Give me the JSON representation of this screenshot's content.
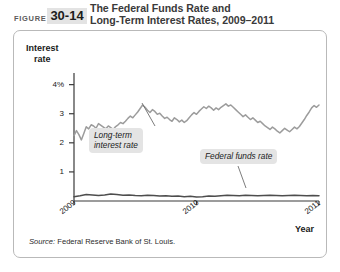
{
  "header": {
    "figure_word": "FIGURE",
    "figure_number": "30-14",
    "title_line1": "The Federal Funds Rate and",
    "title_line2": "Long-Term Interest Rates, 2009–2011"
  },
  "source": {
    "label": "Source:",
    "text": " Federal Reserve Bank of St. Louis."
  },
  "colors": {
    "long_term_line": "#9c9c9c",
    "federal_funds_line": "#4d4d4d",
    "axis": "#3a3a3a",
    "callout_background": "#e4e4e4",
    "panel_border": "#b9b9b9",
    "figure_number_background": "#e3e3e3",
    "title_text": "#3a3a3a"
  },
  "chart_data": {
    "type": "line",
    "title": "The Federal Funds Rate and Long-Term Interest Rates, 2009–2011",
    "xlabel": "Year",
    "ylabel": "Interest rate",
    "ylabel_line1": "Interest",
    "ylabel_line2": "rate",
    "grid": false,
    "legend": "annotations",
    "xlim": [
      2009.0,
      2011.0
    ],
    "ylim": [
      0,
      4.4
    ],
    "ytick_labels": [
      "4%",
      "3",
      "2",
      "1"
    ],
    "ytick_values": [
      4,
      3,
      2,
      1
    ],
    "xtick_labels": [
      "2009",
      "2010",
      "2011"
    ],
    "xtick_values": [
      2009,
      2010,
      2011
    ],
    "annotations": [
      {
        "name": "long-term-interest-rate",
        "line1": "Long-term",
        "line2": "interest rate"
      },
      {
        "name": "federal-funds-rate",
        "line1": "Federal funds rate",
        "line2": ""
      }
    ],
    "series": [
      {
        "name": "Long-term interest rate",
        "color": "#9c9c9c",
        "x": [
          2009.0,
          2009.02,
          2009.04,
          2009.06,
          2009.08,
          2009.1,
          2009.12,
          2009.14,
          2009.16,
          2009.18,
          2009.2,
          2009.22,
          2009.24,
          2009.26,
          2009.28,
          2009.3,
          2009.32,
          2009.34,
          2009.36,
          2009.38,
          2009.4,
          2009.42,
          2009.44,
          2009.46,
          2009.48,
          2009.5,
          2009.52,
          2009.54,
          2009.56,
          2009.58,
          2009.6,
          2009.62,
          2009.64,
          2009.66,
          2009.68,
          2009.7,
          2009.72,
          2009.74,
          2009.76,
          2009.78,
          2009.8,
          2009.82,
          2009.84,
          2009.86,
          2009.88,
          2009.9,
          2009.92,
          2009.94,
          2009.96,
          2009.98,
          2010.0,
          2010.02,
          2010.04,
          2010.06,
          2010.08,
          2010.1,
          2010.12,
          2010.14,
          2010.16,
          2010.18,
          2010.2,
          2010.22,
          2010.24,
          2010.26,
          2010.28,
          2010.3,
          2010.32,
          2010.34,
          2010.36,
          2010.38,
          2010.4,
          2010.42,
          2010.44,
          2010.46,
          2010.48,
          2010.5,
          2010.52,
          2010.54,
          2010.56,
          2010.58,
          2010.6,
          2010.62,
          2010.64,
          2010.66,
          2010.68,
          2010.7,
          2010.72,
          2010.74,
          2010.76,
          2010.78,
          2010.8,
          2010.82,
          2010.84,
          2010.86,
          2010.88,
          2010.9,
          2010.92,
          2010.94,
          2010.96,
          2010.98,
          2011.0
        ],
        "y": [
          2.25,
          2.42,
          2.28,
          2.1,
          2.32,
          2.55,
          2.48,
          2.62,
          2.58,
          2.5,
          2.66,
          2.6,
          2.54,
          2.48,
          2.58,
          2.52,
          2.46,
          2.56,
          2.62,
          2.7,
          2.66,
          2.74,
          2.84,
          2.92,
          2.86,
          2.96,
          3.06,
          3.18,
          3.3,
          3.22,
          3.12,
          3.04,
          3.14,
          3.08,
          2.98,
          3.02,
          2.92,
          2.84,
          2.88,
          2.8,
          2.74,
          2.86,
          2.8,
          2.72,
          2.78,
          2.7,
          2.76,
          2.86,
          2.96,
          3.04,
          2.98,
          3.08,
          3.16,
          3.24,
          3.18,
          3.26,
          3.2,
          3.12,
          3.2,
          3.14,
          3.22,
          3.28,
          3.34,
          3.26,
          3.3,
          3.22,
          3.14,
          3.06,
          2.98,
          2.9,
          2.96,
          2.88,
          2.8,
          2.86,
          2.78,
          2.7,
          2.74,
          2.66,
          2.58,
          2.52,
          2.46,
          2.54,
          2.48,
          2.4,
          2.34,
          2.42,
          2.5,
          2.44,
          2.38,
          2.46,
          2.54,
          2.48,
          2.56,
          2.68,
          2.8,
          2.94,
          3.06,
          3.2,
          3.28,
          3.22,
          3.3
        ]
      },
      {
        "name": "Federal funds rate",
        "color": "#4d4d4d",
        "x": [
          2009.0,
          2009.05,
          2009.1,
          2009.15,
          2009.2,
          2009.25,
          2009.3,
          2009.35,
          2009.4,
          2009.45,
          2009.5,
          2009.55,
          2009.6,
          2009.65,
          2009.7,
          2009.75,
          2009.8,
          2009.85,
          2009.9,
          2009.95,
          2010.0,
          2010.05,
          2010.1,
          2010.15,
          2010.2,
          2010.25,
          2010.3,
          2010.35,
          2010.4,
          2010.45,
          2010.5,
          2010.55,
          2010.6,
          2010.65,
          2010.7,
          2010.75,
          2010.8,
          2010.85,
          2010.9,
          2010.95,
          2011.0
        ],
        "y": [
          0.15,
          0.18,
          0.22,
          0.21,
          0.19,
          0.21,
          0.24,
          0.22,
          0.2,
          0.21,
          0.19,
          0.18,
          0.2,
          0.19,
          0.17,
          0.18,
          0.16,
          0.17,
          0.15,
          0.16,
          0.14,
          0.15,
          0.17,
          0.16,
          0.18,
          0.2,
          0.19,
          0.18,
          0.2,
          0.19,
          0.18,
          0.19,
          0.2,
          0.19,
          0.18,
          0.19,
          0.2,
          0.19,
          0.18,
          0.19,
          0.18
        ]
      }
    ]
  }
}
